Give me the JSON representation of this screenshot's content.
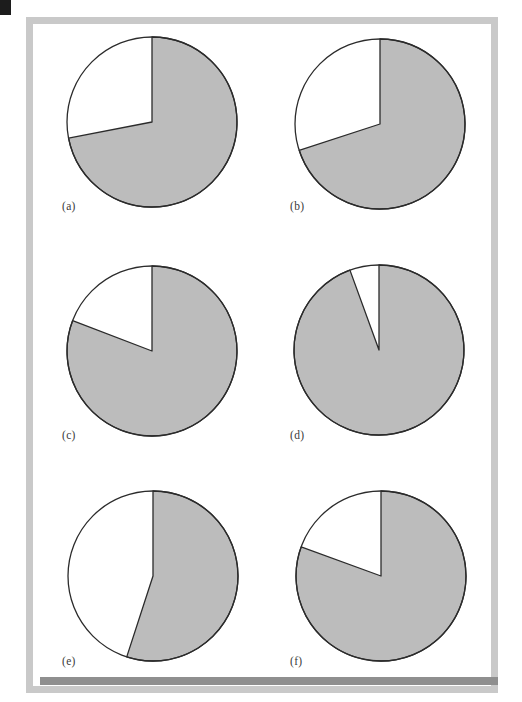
{
  "page": {
    "width": 522,
    "height": 702,
    "background_color": "#ffffff",
    "frame_color": "#c9c9c9",
    "corner_mark_color": "#1c1c1c",
    "bottom_bar_color": "#8f8f8f"
  },
  "style": {
    "slice_fill_color": "#bcbcbc",
    "slice_empty_color": "#ffffff",
    "outline_color": "#2b2b2b",
    "label_color": "#3a3a3a"
  },
  "chart_data": [
    {
      "type": "pie",
      "title": "(a)",
      "labels": [
        "shaded",
        "unshaded"
      ],
      "values": [
        72,
        28
      ],
      "start_angle_deg": 0,
      "shaded_sweep_deg": 259,
      "unshaded_sweep_deg": 101,
      "center": [
        152,
        122
      ],
      "radius": 85,
      "label_pos": [
        62,
        200
      ]
    },
    {
      "type": "pie",
      "title": "(b)",
      "labels": [
        "shaded",
        "unshaded"
      ],
      "values": [
        70,
        30
      ],
      "start_angle_deg": 0,
      "shaded_sweep_deg": 252,
      "unshaded_sweep_deg": 108,
      "center": [
        380,
        124
      ],
      "radius": 85,
      "label_pos": [
        290,
        200
      ]
    },
    {
      "type": "pie",
      "title": "(c)",
      "labels": [
        "shaded",
        "unshaded"
      ],
      "values": [
        81,
        19
      ],
      "start_angle_deg": 0,
      "shaded_sweep_deg": 291,
      "unshaded_sweep_deg": 69,
      "center": [
        152,
        351
      ],
      "radius": 85,
      "label_pos": [
        62,
        429
      ]
    },
    {
      "type": "pie",
      "title": "(d)",
      "labels": [
        "shaded",
        "unshaded"
      ],
      "values": [
        94.5,
        5.5
      ],
      "start_angle_deg": 0,
      "shaded_sweep_deg": 340,
      "unshaded_sweep_deg": 20,
      "center": [
        379,
        350
      ],
      "radius": 85,
      "label_pos": [
        290,
        429
      ]
    },
    {
      "type": "pie",
      "title": "(e)",
      "labels": [
        "shaded",
        "unshaded"
      ],
      "values": [
        55,
        45
      ],
      "start_angle_deg": 0,
      "shaded_sweep_deg": 198,
      "unshaded_sweep_deg": 162,
      "center": [
        153,
        576
      ],
      "radius": 85,
      "label_pos": [
        62,
        655
      ]
    },
    {
      "type": "pie",
      "title": "(f)",
      "labels": [
        "shaded",
        "unshaded"
      ],
      "values": [
        80.5,
        19.5
      ],
      "start_angle_deg": 0,
      "shaded_sweep_deg": 290,
      "unshaded_sweep_deg": 70,
      "center": [
        381,
        576
      ],
      "radius": 85,
      "label_pos": [
        290,
        655
      ]
    }
  ]
}
